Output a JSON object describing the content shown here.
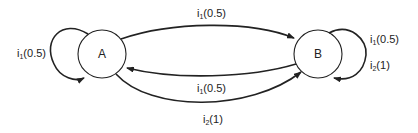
{
  "diagram": {
    "type": "state-transition",
    "nodes": [
      {
        "id": "A",
        "label": "A"
      },
      {
        "id": "B",
        "label": "B"
      }
    ],
    "edges": [
      {
        "from": "A",
        "to": "A",
        "input": "i",
        "sub": "1",
        "prob": "(0.5)"
      },
      {
        "from": "A",
        "to": "B",
        "input": "i",
        "sub": "1",
        "prob": "(0.5)"
      },
      {
        "from": "B",
        "to": "A",
        "input": "i",
        "sub": "1",
        "prob": "(0.5)"
      },
      {
        "from": "A",
        "to": "B",
        "input": "i",
        "sub": "2",
        "prob": "(1)"
      },
      {
        "from": "B",
        "to": "B",
        "input": "i",
        "sub": "1",
        "prob": "(0.5)"
      },
      {
        "from": "B",
        "to": "B",
        "input": "i",
        "sub": "2",
        "prob": "(1)"
      }
    ]
  }
}
